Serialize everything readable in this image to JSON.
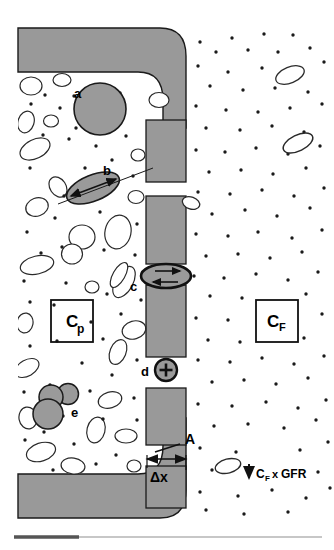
{
  "figure": {
    "running_head": "",
    "running_head_second": "",
    "caption_rule": "horizontal-rule"
  },
  "colors": {
    "wall_fill": "#999999",
    "wall_stroke": "#1a1a1a",
    "cell_fill": "#9a9a9a",
    "cell_stroke": "#1a1a1a",
    "background": "#ffffff",
    "dot": "#1a1a1a",
    "ellipse_fill": "#ffffff",
    "ellipse_stroke": "#2a2a2a",
    "text": "#000000",
    "rule": "#9a9a9a",
    "rule_accent": "#555555",
    "header_text": "#d8d8d8"
  },
  "labels": {
    "a": "a",
    "b": "b",
    "c": "c",
    "d": "d",
    "e": "e",
    "area": "A",
    "thickness": "Δx"
  },
  "boxes": {
    "plasma": {
      "symbol": "C",
      "subscript": "p"
    },
    "filtrate": {
      "symbol": "C",
      "subscript": "F"
    }
  },
  "flux_annotation": {
    "arrow": "↓",
    "symbol": "C",
    "subscript": "F",
    "operator": "x",
    "term": "GFR",
    "full_text": "C_F x GFR"
  },
  "structure": {
    "wall_blocks_count": 5,
    "pores_count": 4,
    "plasma_side": "left",
    "filtrate_side": "right"
  }
}
